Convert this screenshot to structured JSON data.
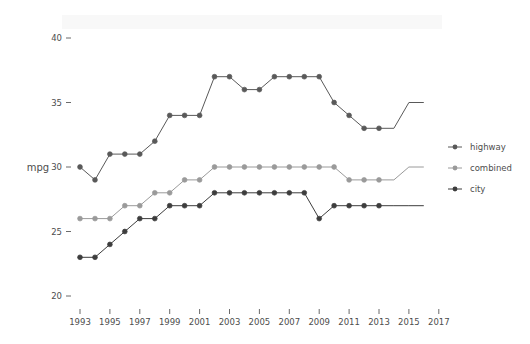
{
  "chart_data": {
    "type": "line",
    "title": "",
    "subtitle": "",
    "xlabel": "",
    "ylabel": "mpg",
    "xlim": [
      1992,
      2018
    ],
    "ylim": [
      19,
      41
    ],
    "grid": false,
    "legend_position": "right",
    "x_ticks": [
      1993,
      1995,
      1997,
      1999,
      2001,
      2003,
      2005,
      2007,
      2009,
      2011,
      2013,
      2015,
      2017
    ],
    "y_ticks": [
      20,
      25,
      30,
      35,
      40
    ],
    "x": [
      1993,
      1994,
      1995,
      1996,
      1997,
      1998,
      1999,
      2000,
      2001,
      2002,
      2003,
      2004,
      2005,
      2006,
      2007,
      2008,
      2009,
      2010,
      2011,
      2012,
      2013
    ],
    "series": [
      {
        "name": "highway",
        "color": "#595959",
        "values": [
          30,
          29,
          31,
          31,
          31,
          32,
          34,
          34,
          34,
          37,
          37,
          36,
          36,
          37,
          37,
          37,
          37,
          35,
          34,
          33,
          33
        ],
        "line_extension": {
          "x": [
            2013,
            2014,
            2015,
            2016
          ],
          "values": [
            33,
            33,
            35,
            35
          ]
        }
      },
      {
        "name": "combined",
        "color": "#9a9a9a",
        "values": [
          26,
          26,
          26,
          27,
          27,
          28,
          28,
          29,
          29,
          30,
          30,
          30,
          30,
          30,
          30,
          30,
          30,
          30,
          29,
          29,
          29
        ],
        "line_extension": {
          "x": [
            2013,
            2014,
            2015,
            2016
          ],
          "values": [
            29,
            29,
            30,
            30
          ]
        }
      },
      {
        "name": "city",
        "color": "#3d3d3d",
        "values": [
          23,
          23,
          24,
          25,
          26,
          26,
          27,
          27,
          27,
          28,
          28,
          28,
          28,
          28,
          28,
          28,
          26,
          27,
          27,
          27,
          27
        ],
        "line_extension": {
          "x": [
            2013,
            2014,
            2015,
            2016
          ],
          "values": [
            27,
            27,
            27,
            27
          ]
        }
      }
    ],
    "legend_entries": [
      {
        "label": "highway",
        "color": "#595959"
      },
      {
        "label": "combined",
        "color": "#9a9a9a"
      },
      {
        "label": "city",
        "color": "#3d3d3d"
      }
    ]
  }
}
